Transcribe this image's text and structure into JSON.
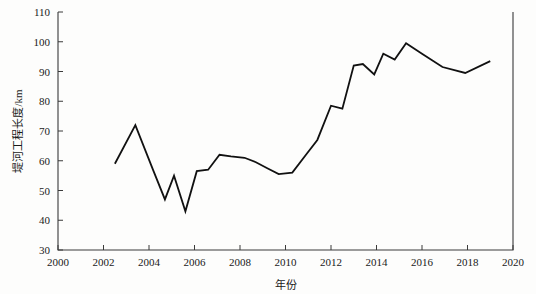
{
  "chart_data": {
    "type": "line",
    "title": "",
    "xlabel": "年份",
    "ylabel": "堤河工程长度/km",
    "xlim": [
      2000,
      2020
    ],
    "ylim": [
      30,
      110
    ],
    "xticks": [
      2000,
      2002,
      2004,
      2006,
      2008,
      2010,
      2012,
      2014,
      2016,
      2018,
      2020
    ],
    "yticks": [
      30,
      40,
      50,
      60,
      70,
      80,
      90,
      100,
      110
    ],
    "xtick_labels": [
      "2000",
      "2002",
      "2004",
      "2006",
      "2008",
      "2010",
      "2012",
      "2014",
      "2016",
      "2018",
      "2020"
    ],
    "ytick_labels": [
      "30",
      "40",
      "50",
      "60",
      "70",
      "80",
      "90",
      "100",
      "110"
    ],
    "grid": false,
    "legend": null,
    "series": [
      {
        "name": "堤河工程长度",
        "color": "#111111",
        "x": [
          2002.5,
          2003.4,
          2004.2,
          2004.7,
          2005.1,
          2005.6,
          2006.1,
          2006.6,
          2007.1,
          2007.6,
          2008.2,
          2008.7,
          2009.2,
          2009.7,
          2010.3,
          2010.9,
          2011.4,
          2012.0,
          2012.5,
          2013.0,
          2013.4,
          2013.9,
          2014.3,
          2014.8,
          2015.3,
          2016.0,
          2016.9,
          2017.9,
          2019.0
        ],
        "y": [
          59.0,
          72.0,
          56.5,
          47.0,
          55.0,
          43.0,
          56.5,
          57.0,
          62.0,
          61.5,
          61.0,
          59.5,
          57.5,
          55.5,
          56.0,
          62.0,
          67.0,
          78.5,
          77.5,
          92.0,
          92.5,
          89.0,
          96.0,
          94.0,
          99.5,
          96.0,
          91.5,
          89.5,
          93.5
        ]
      }
    ]
  },
  "axes": {
    "x_axis_name": "year-axis",
    "y_axis_name": "length-axis"
  }
}
